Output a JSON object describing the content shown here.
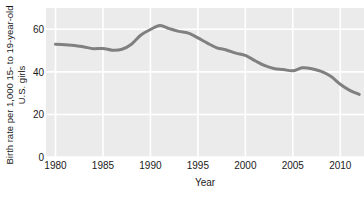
{
  "chart_data": {
    "type": "line",
    "title": "",
    "xlabel": "Year",
    "ylabel_line1": "Birth rate per 1,000 15- to 19-year-old",
    "ylabel_line2": "U.S. girls",
    "xlim": [
      1979,
      2012.5
    ],
    "ylim": [
      0,
      70
    ],
    "xticks": [
      1980,
      1985,
      1990,
      1995,
      2000,
      2005,
      2010
    ],
    "xtick_labels": [
      "1980",
      "1985",
      "1990",
      "1995",
      "2000",
      "2005",
      "2010"
    ],
    "yticks": [
      0,
      20,
      40,
      60
    ],
    "ytick_labels": [
      "0",
      "20",
      "40",
      "60"
    ],
    "grid": true,
    "grid_color": "#ffffff",
    "panel_color": "#ebebeb",
    "legend": "none",
    "series": [
      {
        "name": "Birth rate per 1,000 15- to 19-year-old U.S. girls",
        "color": "#808080",
        "line_width": 3,
        "x": [
          1980,
          1981,
          1982,
          1983,
          1984,
          1985,
          1986,
          1987,
          1988,
          1989,
          1990,
          1991,
          1992,
          1993,
          1994,
          1995,
          1996,
          1997,
          1998,
          1999,
          2000,
          2001,
          2002,
          2003,
          2004,
          2005,
          2006,
          2007,
          2008,
          2009,
          2010,
          2011,
          2012
        ],
        "values": [
          53.0,
          52.7,
          52.4,
          51.7,
          50.9,
          51.0,
          50.2,
          50.6,
          53.0,
          57.3,
          59.9,
          61.8,
          60.3,
          59.0,
          58.2,
          56.0,
          53.5,
          51.3,
          50.3,
          48.8,
          47.7,
          45.3,
          43.0,
          41.6,
          41.1,
          40.5,
          41.9,
          41.5,
          40.2,
          37.9,
          34.2,
          31.3,
          29.4
        ]
      }
    ]
  }
}
